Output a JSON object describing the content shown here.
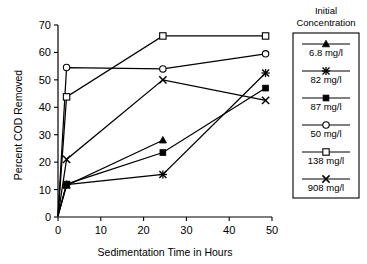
{
  "chart_data": {
    "type": "line",
    "title": "",
    "xlabel": "Sedimentation Time in Hours",
    "ylabel": "Percent COD Removed",
    "xlim": [
      0,
      50
    ],
    "ylim": [
      0,
      70
    ],
    "xticks": [
      0,
      10,
      20,
      30,
      40,
      50
    ],
    "yticks": [
      0,
      10,
      20,
      30,
      40,
      50,
      60,
      70
    ],
    "grid": false,
    "legend_title_line1": "Initial",
    "legend_title_line2": "Concentration",
    "legend_position": "right",
    "series": [
      {
        "name": "6.8 mg/l",
        "marker": "filled-triangle",
        "x": [
          0,
          2,
          24.5
        ],
        "y": [
          0.5,
          11.5,
          28
        ]
      },
      {
        "name": "82 mg/l",
        "marker": "star",
        "x": [
          0,
          2,
          24.5,
          48.5
        ],
        "y": [
          0.5,
          11.8,
          15.5,
          52.5
        ]
      },
      {
        "name": "87 mg/l",
        "marker": "filled-square",
        "x": [
          0,
          2,
          24.5,
          48.5
        ],
        "y": [
          0.5,
          12,
          23.5,
          47
        ]
      },
      {
        "name": "50 mg/l",
        "marker": "open-circle",
        "x": [
          0,
          2,
          24.5,
          48.5
        ],
        "y": [
          0.5,
          54.5,
          54,
          59.5
        ]
      },
      {
        "name": "138 mg/l",
        "marker": "open-square",
        "x": [
          0,
          2,
          24.5,
          48.5
        ],
        "y": [
          0.5,
          43.8,
          66,
          66
        ]
      },
      {
        "name": "908 mg/l",
        "marker": "cross",
        "x": [
          0,
          2,
          24.5,
          48.5
        ],
        "y": [
          0.5,
          21,
          50,
          42.5
        ]
      }
    ]
  },
  "axes": {
    "x_title": "Sedimentation Time in Hours",
    "y_title": "Percent COD Removed",
    "x_tick_labels": [
      "0",
      "10",
      "20",
      "30",
      "40",
      "50"
    ],
    "y_tick_labels": [
      "0",
      "10",
      "20",
      "30",
      "40",
      "50",
      "60",
      "70"
    ]
  },
  "legend": {
    "title_line1": "Initial",
    "title_line2": "Concentration",
    "entries": [
      {
        "label": "6.8 mg/l",
        "marker": "filled-triangle"
      },
      {
        "label": "82 mg/l",
        "marker": "star"
      },
      {
        "label": "87 mg/l",
        "marker": "filled-square"
      },
      {
        "label": "50 mg/l",
        "marker": "open-circle"
      },
      {
        "label": "138 mg/l",
        "marker": "open-square"
      },
      {
        "label": "908 mg/l",
        "marker": "cross"
      }
    ]
  },
  "colors": {
    "ink": "#000000",
    "background": "#ffffff"
  }
}
